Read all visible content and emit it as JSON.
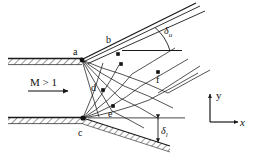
{
  "figure": {
    "type": "method-of-characteristics-supersonic-flow-diagram",
    "background_color": "#ffffff",
    "line_color": "#1a1a1a",
    "inflow": {
      "label": "M > 1",
      "meaning": "supersonic-inflow-mach-number"
    },
    "axes": {
      "x_label": "x",
      "y_label": "y",
      "origin_note": "axis-triad-lower-right"
    },
    "angles": [
      {
        "name": "upper-deflection-angle",
        "label": "δ",
        "subscript": "u"
      },
      {
        "name": "lower-deflection-angle",
        "label": "δ",
        "subscript": "l"
      }
    ],
    "points": [
      {
        "id": "a",
        "label": "a",
        "x": 82,
        "y": 60,
        "role": "upper-wall-trailing-edge"
      },
      {
        "id": "b",
        "label": "b",
        "x": 118,
        "y": 44,
        "role": "upper-slipstream-node"
      },
      {
        "id": "c",
        "label": "c",
        "x": 83,
        "y": 118,
        "role": "lower-wall-trailing-edge"
      },
      {
        "id": "d",
        "label": "d",
        "x": 103,
        "y": 90,
        "role": "interior-net-node"
      },
      {
        "id": "e",
        "label": "e",
        "x": 113,
        "y": 106,
        "role": "interior-net-node"
      },
      {
        "id": "f",
        "label": "f",
        "x": 158,
        "y": 72,
        "role": "interior-net-node"
      }
    ],
    "walls": [
      {
        "name": "upper-wall",
        "hatch": "below"
      },
      {
        "name": "lower-wall",
        "hatch": "below"
      },
      {
        "name": "lower-deflected-boundary",
        "hatch": "below"
      }
    ],
    "features": [
      "upper-expansion-fan-from-a",
      "lower-expansion-fan-from-c",
      "characteristic-net",
      "upper-slipstream",
      "lower-slipstream",
      "horizontal-reference-lines"
    ]
  }
}
